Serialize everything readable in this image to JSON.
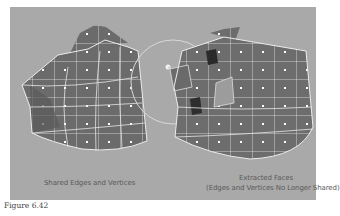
{
  "figure": {
    "label": "Figure 6.42",
    "panel_color": "#a9a9a9",
    "left_caption": "Shared Edges and Vertices",
    "right_caption_line1": "Extracted Faces",
    "right_caption_line2": "(Edges and Vertices No Longer Shared)",
    "illustration": {
      "left_object": "polygon-mesh-shared-edges",
      "right_object": "polygon-mesh-extracted-faces",
      "selection_circle": "manipulator-circle",
      "face_color": "#6e6e6e",
      "edge_color": "#e8e8e8",
      "vertex_color": "#ffffff"
    }
  }
}
